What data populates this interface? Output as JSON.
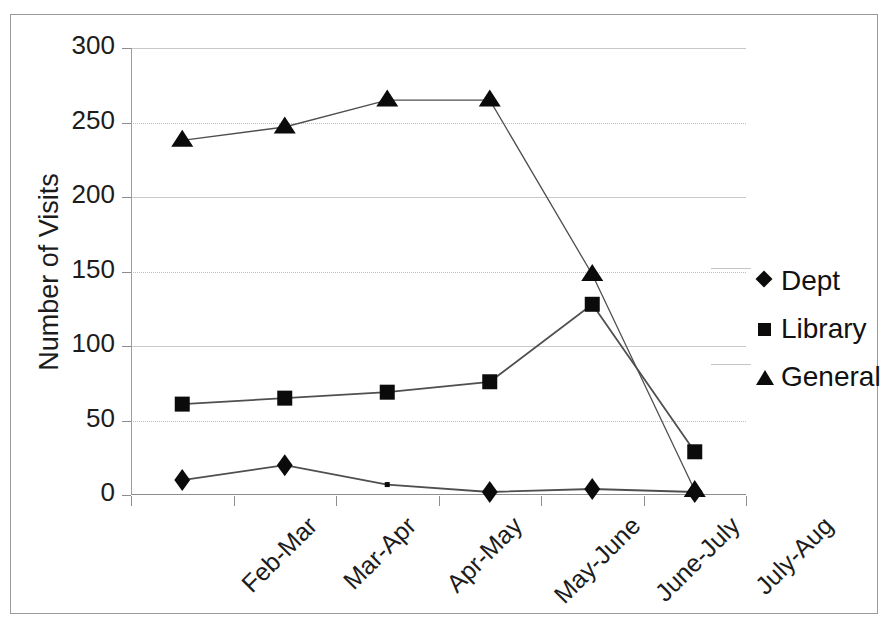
{
  "chart_data": {
    "type": "line",
    "title": "",
    "xlabel": "",
    "ylabel": "Number of Visits",
    "ylim": [
      0,
      300
    ],
    "ytick_step": 50,
    "yticks": [
      300,
      250,
      200,
      150,
      100,
      50,
      0
    ],
    "ytick_labels": [
      "300",
      "250",
      "200",
      "150",
      "100",
      "50",
      "0"
    ],
    "grid": true,
    "legend_position": "right",
    "categories": [
      "Feb-Mar",
      "Mar-Apr",
      "Apr-May",
      "May-June",
      "June-July",
      "July-Aug"
    ],
    "series": [
      {
        "name": "Dept",
        "marker": "diamond",
        "values": [
          10,
          20,
          7,
          2,
          4,
          2
        ]
      },
      {
        "name": "Library",
        "marker": "square",
        "values": [
          61,
          65,
          69,
          76,
          128,
          29
        ]
      },
      {
        "name": "General",
        "marker": "triangle",
        "values": [
          238,
          247,
          265,
          265,
          148,
          3
        ]
      }
    ],
    "colors": {
      "series_line": "#4f4f4f",
      "marker": "#0b0b0b",
      "gridline": "#c9c9c9",
      "axis": "#8d8d8d",
      "text": "#1c1c1c",
      "frame": "#9a9a9a",
      "background": "#ffffff"
    }
  },
  "legend": {
    "items": [
      {
        "label": "Dept",
        "marker": "diamond-marker-icon"
      },
      {
        "label": "Library",
        "marker": "square-marker-icon"
      },
      {
        "label": "General",
        "marker": "triangle-marker-icon"
      }
    ]
  }
}
